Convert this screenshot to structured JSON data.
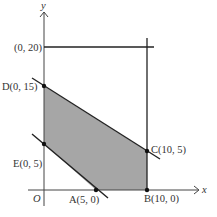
{
  "diagram": {
    "type": "linear-programming-feasible-region",
    "axes": {
      "x_label": "x",
      "y_label": "y",
      "origin_label": "O"
    },
    "points": [
      {
        "name": "A",
        "coords": "(5, 0)",
        "label": "A(5, 0)"
      },
      {
        "name": "B",
        "coords": "(10, 0)",
        "label": "B(10, 0)"
      },
      {
        "name": "C",
        "coords": "(10, 5)",
        "label": "C(10, 5)"
      },
      {
        "name": "D",
        "coords": "(0, 15)",
        "label": "D(0, 15)"
      },
      {
        "name": "E",
        "coords": "(0, 5)",
        "label": "E(0, 5)"
      }
    ],
    "extra_labels": {
      "y20": "(0, 20)"
    },
    "colors": {
      "region_fill": "#a6a6a6",
      "line": "#222222",
      "axis": "#444444"
    }
  }
}
